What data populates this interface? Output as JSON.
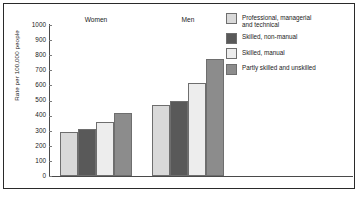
{
  "chart_data": {
    "type": "bar",
    "title": "",
    "xlabel": "",
    "ylabel": "Rate per 100,000 people",
    "ylim": [
      0,
      1000
    ],
    "ytick_step": 100,
    "yticks": [
      "1000",
      "900",
      "800",
      "700",
      "600",
      "500",
      "400",
      "300",
      "200",
      "100",
      "0"
    ],
    "grid": false,
    "legend_position": "right",
    "categories": [
      "Women",
      "Men"
    ],
    "series": [
      {
        "name": "Professional, managerial and technical",
        "values": [
          290,
          470
        ],
        "color": "#d9d9d9"
      },
      {
        "name": "Skilled, non-manual",
        "values": [
          310,
          495
        ],
        "color": "#595959"
      },
      {
        "name": "Skilled, manual",
        "values": [
          360,
          615
        ],
        "color": "#ededed"
      },
      {
        "name": "Partly skilled and unskilled",
        "values": [
          415,
          775
        ],
        "color": "#8c8c8c"
      }
    ]
  },
  "legend": {
    "items": [
      {
        "label_line1": "Professional, managerial",
        "label_line2": "and technical"
      },
      {
        "label_line1": "Skilled, non-manual",
        "label_line2": ""
      },
      {
        "label_line1": "Skilled, manual",
        "label_line2": ""
      },
      {
        "label_line1": "Partly skilled and unskilled",
        "label_line2": ""
      }
    ]
  }
}
